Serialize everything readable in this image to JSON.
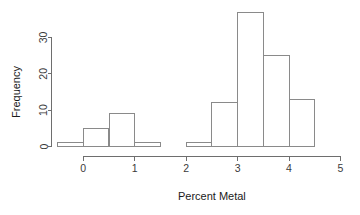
{
  "chart_data": {
    "type": "bar",
    "title": "",
    "subtitle": "",
    "xlabel": "Percent Metal",
    "ylabel": "Frequency",
    "xlim": [
      -0.5,
      5.0
    ],
    "ylim": [
      0,
      37
    ],
    "grid": false,
    "legend": null,
    "bin_width": 0.5,
    "bins": [
      {
        "left": -0.5,
        "right": 0.0,
        "count": 1
      },
      {
        "left": 0.0,
        "right": 0.5,
        "count": 5
      },
      {
        "left": 0.5,
        "right": 1.0,
        "count": 9
      },
      {
        "left": 1.0,
        "right": 1.5,
        "count": 1
      },
      {
        "left": 1.5,
        "right": 2.0,
        "count": 0
      },
      {
        "left": 2.0,
        "right": 2.5,
        "count": 1
      },
      {
        "left": 2.5,
        "right": 3.0,
        "count": 12
      },
      {
        "left": 3.0,
        "right": 3.5,
        "count": 37
      },
      {
        "left": 3.5,
        "right": 4.0,
        "count": 25
      },
      {
        "left": 4.0,
        "right": 4.5,
        "count": 13
      }
    ],
    "categories": [
      "-0.5-0",
      "0-0.5",
      "0.5-1",
      "1-1.5",
      "1.5-2",
      "2-2.5",
      "2.5-3",
      "3-3.5",
      "3.5-4",
      "4-4.5"
    ],
    "values": [
      1,
      5,
      9,
      1,
      0,
      1,
      12,
      37,
      25,
      13
    ],
    "x_ticks": [
      {
        "value": 0,
        "label": "0"
      },
      {
        "value": 1,
        "label": "1"
      },
      {
        "value": 2,
        "label": "2"
      },
      {
        "value": 3,
        "label": "3"
      },
      {
        "value": 4,
        "label": "4"
      },
      {
        "value": 5,
        "label": "5"
      }
    ],
    "y_ticks": [
      {
        "value": 0,
        "label": "0"
      },
      {
        "value": 10,
        "label": "10"
      },
      {
        "value": 20,
        "label": "20"
      },
      {
        "value": 30,
        "label": "30"
      }
    ],
    "colors": {
      "background": "#ffffff",
      "bar_stroke": "#8a8a8a",
      "axis": "#6e6e6e",
      "tick_label": "#3b3b3b",
      "axis_title": "#1a1a1a"
    }
  }
}
